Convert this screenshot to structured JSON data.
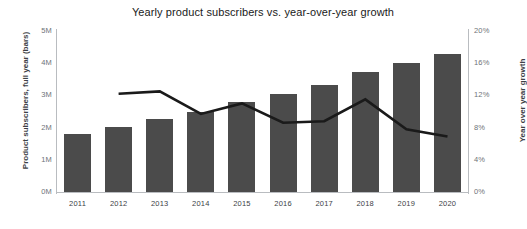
{
  "chart_data": {
    "type": "bar",
    "title": "Yearly product subscribers vs. year-over-year growth",
    "xlabel": "",
    "ylabel": "Product subscribers, full year (bars)",
    "y2label": "Year over year growth",
    "categories": [
      "2011",
      "2012",
      "2013",
      "2014",
      "2015",
      "2016",
      "2017",
      "2018",
      "2019",
      "2020"
    ],
    "ylim": [
      0,
      5000000
    ],
    "y2lim": [
      0,
      20
    ],
    "ytick_labels": [
      "0M",
      "1M",
      "2M",
      "3M",
      "4M",
      "5M"
    ],
    "ytick_values": [
      0,
      1000000,
      2000000,
      3000000,
      4000000,
      5000000
    ],
    "y2tick_labels": [
      "0%",
      "4%",
      "8%",
      "12%",
      "16%",
      "20%"
    ],
    "y2tick_values": [
      0,
      4,
      8,
      12,
      16,
      20
    ],
    "grid": false,
    "legend": "none",
    "series": [
      {
        "name": "Product subscribers, full year (bars)",
        "type": "bar",
        "axis": "left",
        "color": "#4b4b4b",
        "values": [
          1800000,
          2030000,
          2270000,
          2500000,
          2800000,
          3050000,
          3320000,
          3720000,
          4020000,
          4280000
        ]
      },
      {
        "name": "Year over year growth",
        "type": "line",
        "axis": "right",
        "color": "#1a1a1a",
        "values": [
          null,
          12.2,
          12.5,
          9.7,
          11.0,
          8.6,
          8.8,
          11.5,
          7.8,
          6.9
        ]
      }
    ]
  }
}
